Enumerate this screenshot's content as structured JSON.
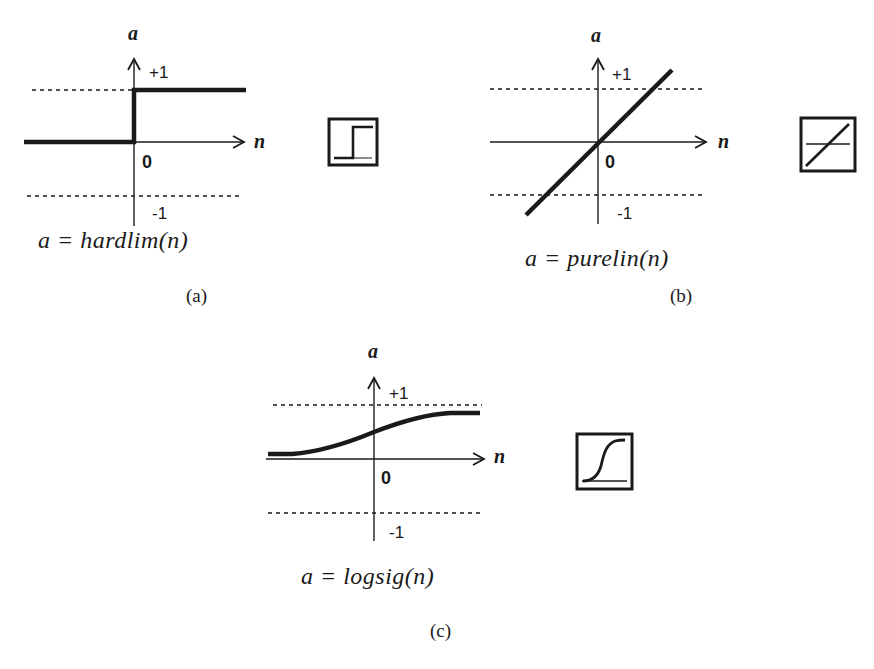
{
  "figure": {
    "panels": [
      {
        "id": "a",
        "caption": "(a)",
        "formula": "a = hardlim(n)",
        "function": "hardlim",
        "y_axis_label": "a",
        "x_axis_label": "n",
        "upper_tick": "+1",
        "origin_tick": "0",
        "lower_tick": "-1",
        "icon": "hardlim-step-icon"
      },
      {
        "id": "b",
        "caption": "(b)",
        "formula": "a = purelin(n)",
        "function": "purelin",
        "y_axis_label": "a",
        "x_axis_label": "n",
        "upper_tick": "+1",
        "origin_tick": "0",
        "lower_tick": "-1",
        "icon": "purelin-linear-icon"
      },
      {
        "id": "c",
        "caption": "(c)",
        "formula": "a = logsig(n)",
        "function": "logsig",
        "y_axis_label": "a",
        "x_axis_label": "n",
        "upper_tick": "+1",
        "origin_tick": "0",
        "lower_tick": "-1",
        "icon": "logsig-sigmoid-icon"
      }
    ]
  },
  "colors": {
    "ink": "#1a1a1a",
    "background": "#ffffff"
  }
}
